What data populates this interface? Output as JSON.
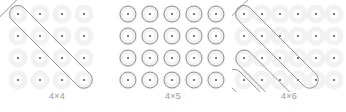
{
  "page": {
    "background_color": "#ffffff",
    "stroke_color": "#8e8e8e",
    "halo_color": "#f2f2f2",
    "dot_color": "#7d7d7d",
    "caption_color": "#9a9a9a"
  },
  "figures": [
    {
      "id": "fig-4x4",
      "caption": "4×4",
      "name": "kolam-pattern-4x4",
      "rows": 4,
      "cols": 4,
      "dot_count": 16,
      "pattern": "two crossing diagonal loops forming an X",
      "loop_count": 2
    },
    {
      "id": "fig-4x5",
      "caption": "4×5",
      "name": "kolam-pattern-4x5",
      "rows": 4,
      "cols": 5,
      "dot_count": 20,
      "pattern": "dense diamond lattice, each dot enclosed by a diamond loop",
      "loop_count": 20
    },
    {
      "id": "fig-4x6",
      "caption": "4×6",
      "name": "kolam-pattern-4x6",
      "rows": 4,
      "cols": 6,
      "dot_count": 24,
      "pattern": "overlapping diagonal loops, X on the left with stacked loops to the right",
      "loop_count": 4
    }
  ]
}
